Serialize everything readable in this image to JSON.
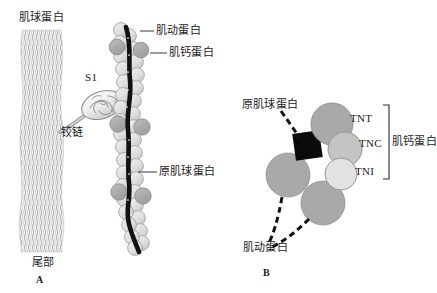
{
  "figure": {
    "title_visible": false,
    "background": "#ffffff",
    "width": 437,
    "height": 293
  },
  "colors": {
    "ink": "#1a1a1a",
    "tropomyosin_strand": "#111111",
    "actin_bead_fill": "#dedede",
    "actin_bead_stroke": "#9a9a9a",
    "troponin_bead_fill": "#a8a8a8",
    "troponin_bead_stroke": "#8c8c8c",
    "myosin_tail_light": "#f2f2f2",
    "myosin_tail_dark": "#b9b9b9",
    "tnt_fill": "#a9a9a9",
    "tnc_fill": "#c4c4c4",
    "tni_fill": "#e2e2e2",
    "actin_circle_fill": "#a9a9a9",
    "tropomyosin_square_fill": "#0b0b0b",
    "leader_line": "#3a3a3a"
  },
  "panel_a": {
    "id": "A",
    "panel_label": "A",
    "labels": {
      "myosin": "肌球蛋白",
      "tail": "尾部",
      "s1": "S1",
      "hinge": "铰链",
      "actin": "肌动蛋白",
      "troponin": "肌钙蛋白",
      "tropomyosin": "原肌球蛋白"
    }
  },
  "panel_b": {
    "id": "B",
    "panel_label": "B",
    "labels": {
      "tropomyosin": "原肌球蛋白",
      "actin": "肌动蛋白",
      "troponin_bracket": "肌钙蛋白"
    },
    "subunits": [
      {
        "name": "TNT",
        "label": "TNT"
      },
      {
        "name": "TNC",
        "label": "TNC"
      },
      {
        "name": "TNI",
        "label": "TNI"
      }
    ]
  }
}
